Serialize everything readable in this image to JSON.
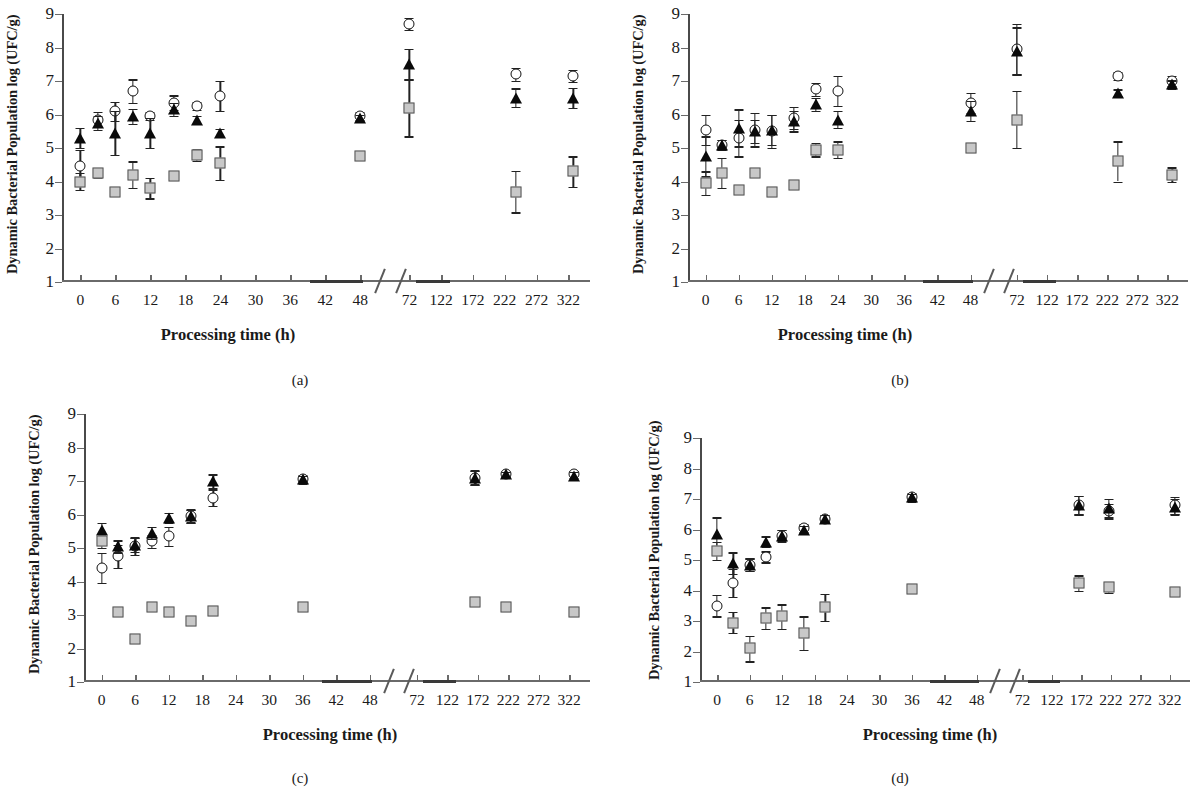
{
  "figure": {
    "ylabel": "Dynamic Bacterial Population log (UFC/g)",
    "xlabel": "Processing time (h)",
    "yticks": [
      "9",
      "8",
      "7",
      "6",
      "5",
      "4",
      "3",
      "2",
      "1"
    ],
    "xticks": [
      "0",
      "6",
      "12",
      "18",
      "24",
      "30",
      "36",
      "42",
      "48",
      "72",
      "122",
      "172",
      "222",
      "272",
      "322"
    ],
    "captions": [
      "(a)",
      "(b)",
      "(c)",
      "(d)"
    ],
    "series_names": [
      "open-circle",
      "filled-triangle",
      "gray-square"
    ],
    "colors": {
      "circle": "#111111",
      "triangle": "#0a0a0a",
      "square": "#c8c8c8",
      "axis": "#6a6a6a"
    }
  },
  "chart_data": [
    {
      "type": "scatter",
      "panel": "(a)",
      "title": "",
      "xlabel": "Processing time (h)",
      "ylabel": "Dynamic Bacterial Population log (UFC/g)",
      "ylim": [
        1,
        9
      ],
      "xtick_labels": [
        "0",
        "6",
        "12",
        "18",
        "24",
        "30",
        "36",
        "42",
        "48",
        "72",
        "122",
        "172",
        "222",
        "272",
        "322"
      ],
      "axis_break": true,
      "grid": false,
      "series": [
        {
          "name": "open-circle",
          "marker": "circle",
          "x": [
            0,
            3,
            6,
            9,
            12,
            16,
            20,
            24,
            48,
            72,
            240,
            330
          ],
          "values": [
            4.45,
            5.85,
            6.1,
            6.7,
            5.95,
            6.35,
            6.25,
            6.55,
            5.95,
            8.7,
            7.2,
            7.15
          ],
          "errors": [
            0.5,
            0.22,
            0.28,
            0.35,
            0.12,
            0.22,
            0.12,
            0.45,
            0.12,
            0.18,
            0.2,
            0.18
          ]
        },
        {
          "name": "filled-triangle",
          "marker": "triangle",
          "x": [
            0,
            3,
            6,
            9,
            12,
            16,
            20,
            24,
            48,
            72,
            240,
            330
          ],
          "values": [
            5.3,
            5.75,
            5.45,
            5.95,
            5.45,
            6.15,
            5.85,
            5.45,
            5.9,
            7.5,
            6.5,
            6.5
          ],
          "errors": [
            0.3,
            0.2,
            0.65,
            0.22,
            0.45,
            0.2,
            0.12,
            0.12,
            0.1,
            0.45,
            0.28,
            0.3
          ]
        },
        {
          "name": "gray-square",
          "marker": "square",
          "x": [
            0,
            3,
            6,
            9,
            12,
            16,
            20,
            24,
            48,
            72,
            240,
            330
          ],
          "values": [
            4.0,
            4.25,
            3.7,
            4.2,
            3.8,
            4.15,
            4.8,
            4.55,
            4.75,
            6.2,
            3.7,
            4.3
          ],
          "errors": [
            0.25,
            0.15,
            0.1,
            0.4,
            0.3,
            0.08,
            0.18,
            0.5,
            0.05,
            0.85,
            0.62,
            0.45
          ]
        }
      ]
    },
    {
      "type": "scatter",
      "panel": "(b)",
      "title": "",
      "xlabel": "Processing time (h)",
      "ylabel": "Dynamic Bacterial Population log (UFC/g)",
      "ylim": [
        1,
        9
      ],
      "xtick_labels": [
        "0",
        "6",
        "12",
        "18",
        "24",
        "30",
        "36",
        "42",
        "48",
        "72",
        "122",
        "172",
        "222",
        "272",
        "322"
      ],
      "axis_break": true,
      "grid": false,
      "series": [
        {
          "name": "open-circle",
          "marker": "circle",
          "x": [
            0,
            3,
            6,
            9,
            12,
            16,
            20,
            24,
            48,
            72,
            240,
            330
          ],
          "values": [
            5.55,
            5.1,
            5.3,
            5.55,
            5.5,
            5.9,
            6.75,
            6.7,
            6.35,
            7.95,
            7.15,
            7.0
          ],
          "errors": [
            0.45,
            0.15,
            0.55,
            0.5,
            0.5,
            0.32,
            0.2,
            0.45,
            0.3,
            0.75,
            0.12,
            0.15
          ]
        },
        {
          "name": "filled-triangle",
          "marker": "triangle",
          "x": [
            0,
            3,
            6,
            9,
            12,
            16,
            20,
            24,
            48,
            72,
            240,
            330
          ],
          "values": [
            4.75,
            5.1,
            5.6,
            5.5,
            5.55,
            5.8,
            6.3,
            5.85,
            6.1,
            7.9,
            6.65,
            6.9
          ],
          "errors": [
            0.6,
            0.15,
            0.55,
            0.35,
            0.45,
            0.3,
            0.2,
            0.25,
            0.3,
            0.7,
            0.1,
            0.12
          ]
        },
        {
          "name": "gray-square",
          "marker": "square",
          "x": [
            0,
            3,
            6,
            9,
            12,
            16,
            20,
            24,
            48,
            72,
            240,
            330
          ],
          "values": [
            3.95,
            4.25,
            3.75,
            4.25,
            3.7,
            3.9,
            4.95,
            4.95,
            5.0,
            5.85,
            4.6,
            4.2
          ],
          "errors": [
            0.35,
            0.45,
            0.12,
            0.1,
            0.1,
            0.1,
            0.2,
            0.25,
            0.12,
            0.85,
            0.6,
            0.22
          ]
        }
      ]
    },
    {
      "type": "scatter",
      "panel": "(c)",
      "title": "",
      "xlabel": "Processing time (h)",
      "ylabel": "Dynamic Bacterial Population log (UFC/g)",
      "ylim": [
        1,
        9
      ],
      "xtick_labels": [
        "0",
        "6",
        "12",
        "18",
        "24",
        "30",
        "36",
        "42",
        "48",
        "72",
        "122",
        "172",
        "222",
        "272",
        "322"
      ],
      "axis_break": true,
      "grid": false,
      "series": [
        {
          "name": "open-circle",
          "marker": "circle",
          "x": [
            0,
            3,
            6,
            9,
            12,
            16,
            20,
            36,
            168,
            218,
            330
          ],
          "values": [
            4.4,
            4.75,
            5.05,
            5.2,
            5.35,
            5.95,
            6.5,
            7.05,
            7.1,
            7.2,
            7.2
          ],
          "errors": [
            0.45,
            0.35,
            0.25,
            0.2,
            0.28,
            0.2,
            0.25,
            0.12,
            0.22,
            0.08,
            0.1
          ]
        },
        {
          "name": "filled-triangle",
          "marker": "triangle",
          "x": [
            0,
            3,
            6,
            9,
            12,
            16,
            20,
            36,
            168,
            218,
            330
          ],
          "values": [
            5.55,
            5.05,
            5.1,
            5.45,
            5.9,
            5.95,
            7.0,
            7.05,
            7.1,
            7.2,
            7.15
          ],
          "errors": [
            0.2,
            0.18,
            0.22,
            0.18,
            0.15,
            0.18,
            0.2,
            0.1,
            0.2,
            0.08,
            0.12
          ]
        },
        {
          "name": "gray-square",
          "marker": "square",
          "x": [
            0,
            3,
            6,
            9,
            12,
            16,
            20,
            36,
            168,
            218,
            330
          ],
          "values": [
            5.2,
            3.1,
            2.27,
            3.25,
            3.1,
            2.82,
            3.12,
            3.25,
            3.4,
            3.25,
            3.1
          ],
          "errors": [
            0.2,
            0.05,
            0.05,
            0.05,
            0.05,
            0.05,
            0.05,
            0.05,
            0.05,
            0.05,
            0.05
          ]
        }
      ]
    },
    {
      "type": "scatter",
      "panel": "(d)",
      "title": "",
      "xlabel": "Processing time (h)",
      "ylabel": "Dynamic Bacterial Population log (UFC/g)",
      "ylim": [
        1,
        9
      ],
      "xtick_labels": [
        "0",
        "6",
        "12",
        "18",
        "24",
        "30",
        "36",
        "42",
        "48",
        "72",
        "122",
        "172",
        "222",
        "272",
        "322"
      ],
      "axis_break": true,
      "grid": false,
      "series": [
        {
          "name": "open-circle",
          "marker": "circle",
          "x": [
            0,
            3,
            6,
            9,
            12,
            16,
            20,
            36,
            168,
            218,
            330
          ],
          "values": [
            3.5,
            4.25,
            4.85,
            5.1,
            5.8,
            6.05,
            6.35,
            7.05,
            6.8,
            6.6,
            6.8
          ],
          "errors": [
            0.35,
            0.45,
            0.2,
            0.18,
            0.2,
            0.12,
            0.12,
            0.15,
            0.3,
            0.25,
            0.28
          ]
        },
        {
          "name": "filled-triangle",
          "marker": "triangle",
          "x": [
            0,
            3,
            6,
            9,
            12,
            16,
            20,
            36,
            168,
            218,
            330
          ],
          "values": [
            5.85,
            4.9,
            4.85,
            5.6,
            5.8,
            6.0,
            6.35,
            7.05,
            6.8,
            6.7,
            6.75
          ],
          "errors": [
            0.55,
            0.35,
            0.2,
            0.18,
            0.18,
            0.12,
            0.12,
            0.12,
            0.3,
            0.3,
            0.25
          ]
        },
        {
          "name": "gray-square",
          "marker": "square",
          "x": [
            0,
            3,
            6,
            9,
            12,
            16,
            20,
            36,
            168,
            218,
            330
          ],
          "values": [
            5.3,
            2.95,
            2.1,
            3.1,
            3.15,
            2.6,
            3.45,
            4.05,
            4.25,
            4.1,
            3.95
          ],
          "errors": [
            0.3,
            0.35,
            0.42,
            0.35,
            0.4,
            0.55,
            0.45,
            0.08,
            0.25,
            0.18,
            0.12
          ]
        }
      ]
    }
  ]
}
